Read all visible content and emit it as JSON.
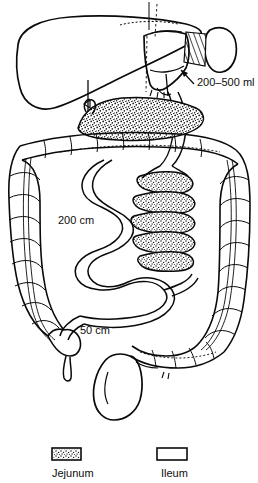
{
  "figure": {
    "type": "anatomical-line-diagram",
    "background_color": "#ffffff",
    "ink_color": "#0a0a0a"
  },
  "annotations": {
    "pouch_volume": {
      "text": "200–500 ml",
      "x": 197,
      "y": 86,
      "leader_from": [
        196,
        82
      ],
      "leader_to": [
        181,
        70
      ]
    },
    "jejunal_limb": {
      "text": "200 cm",
      "x": 58,
      "y": 224
    },
    "ileal_limb": {
      "text": "50 cm",
      "x": 80,
      "y": 334
    }
  },
  "legend": {
    "items": [
      {
        "label": "Jejunum",
        "swatch": "stippled",
        "swatch_fill": "#ffffff",
        "swatch_x": 52,
        "swatch_y": 448,
        "swatch_w": 29,
        "swatch_h": 12,
        "label_x": 52,
        "label_y": 477
      },
      {
        "label": "Ileum",
        "swatch": "plain",
        "swatch_fill": "#ffffff",
        "swatch_x": 157,
        "swatch_y": 448,
        "swatch_w": 30,
        "swatch_h": 12,
        "label_x": 161,
        "label_y": 477
      }
    ]
  },
  "organs": [
    {
      "name": "liver",
      "shading": "outline"
    },
    {
      "name": "stomach-pouch",
      "shading": "outline"
    },
    {
      "name": "spleen",
      "shading": "outline"
    },
    {
      "name": "gastric-remnant-hatching",
      "shading": "hatched"
    },
    {
      "name": "transverse-colon",
      "shading": "haustra"
    },
    {
      "name": "ascending-colon",
      "shading": "haustra"
    },
    {
      "name": "descending-colon",
      "shading": "haustra"
    },
    {
      "name": "sigmoid-colon",
      "shading": "haustra"
    },
    {
      "name": "rectum-bladder",
      "shading": "outline"
    },
    {
      "name": "cecum",
      "shading": "outline"
    },
    {
      "name": "appendix",
      "shading": "outline"
    },
    {
      "name": "jejunum-coils",
      "shading": "stippled"
    },
    {
      "name": "jejunum-proximal-band",
      "shading": "stippled"
    },
    {
      "name": "ileum-loops",
      "shading": "outline"
    }
  ]
}
